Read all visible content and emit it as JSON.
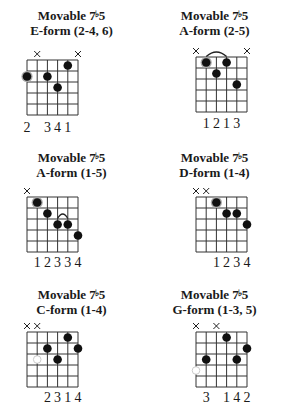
{
  "chords": [
    {
      "title_line1": "Movable 7",
      "flat": "♭",
      "title_num": "5",
      "title_line2": "E-form (2-4, 6)",
      "muted": [
        2,
        6
      ],
      "barre": null,
      "dots": [
        {
          "string": 1,
          "fret": 2,
          "root": true
        },
        {
          "string": 3,
          "fret": 2,
          "root": false
        },
        {
          "string": 4,
          "fret": 3,
          "root": false
        },
        {
          "string": 5,
          "fret": 1,
          "root": false
        }
      ],
      "open_circles": [],
      "fingering": [
        "2",
        "",
        "3",
        "4",
        "1",
        ""
      ]
    },
    {
      "title_line1": "Movable 7",
      "flat": "♭",
      "title_num": "5",
      "title_line2": "A-form (2-5)",
      "muted": [
        1,
        6
      ],
      "barre": {
        "from": 2,
        "to": 4,
        "fret": 1
      },
      "dots": [
        {
          "string": 2,
          "fret": 1,
          "root": true
        },
        {
          "string": 3,
          "fret": 2,
          "root": false
        },
        {
          "string": 4,
          "fret": 1,
          "root": false
        },
        {
          "string": 5,
          "fret": 3,
          "root": false
        }
      ],
      "open_circles": [],
      "fingering": [
        "",
        "1",
        "2",
        "1",
        "3",
        ""
      ]
    },
    {
      "title_line1": "Movable 7",
      "flat": "♭",
      "title_num": "5",
      "title_line2": "A-form (1-5)",
      "muted": [
        1
      ],
      "barre": {
        "from": 4,
        "to": 5,
        "fret": 3
      },
      "dots": [
        {
          "string": 2,
          "fret": 1,
          "root": true
        },
        {
          "string": 3,
          "fret": 2,
          "root": false
        },
        {
          "string": 4,
          "fret": 3,
          "root": false
        },
        {
          "string": 5,
          "fret": 3,
          "root": false
        },
        {
          "string": 6,
          "fret": 4,
          "root": false
        }
      ],
      "open_circles": [],
      "fingering": [
        "",
        "1",
        "2",
        "3",
        "3",
        "4"
      ]
    },
    {
      "title_line1": "Movable 7",
      "flat": "♭",
      "title_num": "5",
      "title_line2": "D-form (1-4)",
      "muted": [
        1,
        2
      ],
      "barre": null,
      "dots": [
        {
          "string": 3,
          "fret": 1,
          "root": true
        },
        {
          "string": 4,
          "fret": 2,
          "root": false
        },
        {
          "string": 5,
          "fret": 2,
          "root": false
        },
        {
          "string": 6,
          "fret": 3,
          "root": false
        }
      ],
      "open_circles": [],
      "fingering": [
        "",
        "",
        "1",
        "2",
        "3",
        "4"
      ]
    },
    {
      "title_line1": "Movable 7",
      "flat": "♭",
      "title_num": "5",
      "title_line2": "C-form (1-4)",
      "muted": [
        1,
        2
      ],
      "barre": null,
      "dots": [
        {
          "string": 3,
          "fret": 2,
          "root": false
        },
        {
          "string": 4,
          "fret": 3,
          "root": false
        },
        {
          "string": 5,
          "fret": 1,
          "root": false
        },
        {
          "string": 6,
          "fret": 2,
          "root": false
        }
      ],
      "open_circles": [
        {
          "string": 2,
          "fret": 3
        }
      ],
      "fingering": [
        "",
        "",
        "2",
        "3",
        "1",
        "4"
      ]
    },
    {
      "title_line1": "Movable 7",
      "flat": "♭",
      "title_num": "5",
      "title_line2": "G-form (1-3, 5)",
      "muted": [
        1,
        3
      ],
      "barre": null,
      "dots": [
        {
          "string": 2,
          "fret": 3,
          "root": false
        },
        {
          "string": 4,
          "fret": 1,
          "root": false
        },
        {
          "string": 5,
          "fret": 3,
          "root": false
        },
        {
          "string": 6,
          "fret": 2,
          "root": false
        }
      ],
      "open_circles": [
        {
          "string": 1,
          "fret": 4
        }
      ],
      "fingering": [
        "",
        "3",
        "",
        "1",
        "4",
        "2"
      ]
    }
  ]
}
